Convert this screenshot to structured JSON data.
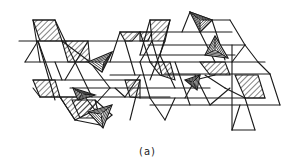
{
  "figure": {
    "caption": "(a)",
    "stroke_color": "#1a1a1a",
    "background": "#ffffff",
    "hatch_color": "#1a1a1a",
    "lines": [
      [
        19,
        41,
        152,
        41
      ],
      [
        25,
        62,
        152,
        62
      ],
      [
        140,
        32,
        232,
        32
      ],
      [
        148,
        45,
        245,
        45
      ],
      [
        140,
        55,
        235,
        55
      ],
      [
        155,
        62,
        265,
        62
      ],
      [
        165,
        74,
        270,
        74
      ],
      [
        33,
        80,
        140,
        80
      ],
      [
        40,
        97,
        170,
        97
      ],
      [
        70,
        88,
        210,
        88
      ],
      [
        110,
        75,
        200,
        75
      ],
      [
        140,
        98,
        265,
        98
      ],
      [
        150,
        105,
        280,
        105
      ],
      [
        33,
        20,
        55,
        20
      ],
      [
        33,
        20,
        40,
        62
      ],
      [
        55,
        20,
        75,
        62
      ],
      [
        38,
        41,
        25,
        62
      ],
      [
        38,
        41,
        52,
        80
      ],
      [
        38,
        41,
        55,
        100
      ],
      [
        62,
        41,
        90,
        62
      ],
      [
        75,
        62,
        92,
        97
      ],
      [
        55,
        62,
        62,
        80
      ],
      [
        90,
        62,
        110,
        88
      ],
      [
        88,
        41,
        65,
        80
      ],
      [
        120,
        32,
        140,
        32
      ],
      [
        120,
        32,
        110,
        62
      ],
      [
        140,
        32,
        150,
        62
      ],
      [
        150,
        20,
        170,
        20
      ],
      [
        150,
        20,
        140,
        55
      ],
      [
        170,
        20,
        160,
        55
      ],
      [
        125,
        41,
        135,
        75
      ],
      [
        152,
        41,
        162,
        75
      ],
      [
        152,
        41,
        140,
        62
      ],
      [
        140,
        62,
        150,
        98
      ],
      [
        160,
        55,
        175,
        88
      ],
      [
        175,
        62,
        190,
        105
      ],
      [
        165,
        41,
        150,
        80
      ],
      [
        190,
        12,
        182,
        32
      ],
      [
        190,
        12,
        212,
        20
      ],
      [
        212,
        20,
        200,
        32
      ],
      [
        200,
        32,
        215,
        62
      ],
      [
        212,
        20,
        230,
        20
      ],
      [
        230,
        20,
        245,
        45
      ],
      [
        212,
        20,
        225,
        60
      ],
      [
        245,
        45,
        232,
        62
      ],
      [
        245,
        45,
        258,
        62
      ],
      [
        232,
        45,
        232,
        130
      ],
      [
        258,
        62,
        270,
        74
      ],
      [
        205,
        75,
        225,
        88
      ],
      [
        225,
        88,
        245,
        98
      ],
      [
        230,
        88,
        210,
        105
      ],
      [
        245,
        98,
        255,
        130
      ],
      [
        255,
        130,
        232,
        130
      ],
      [
        232,
        130,
        240,
        105
      ],
      [
        33,
        88,
        40,
        97
      ],
      [
        60,
        97,
        75,
        120
      ],
      [
        75,
        120,
        100,
        125
      ],
      [
        100,
        125,
        112,
        115
      ],
      [
        112,
        115,
        95,
        100
      ],
      [
        90,
        110,
        110,
        88
      ],
      [
        115,
        88,
        125,
        97
      ],
      [
        125,
        97,
        140,
        75
      ],
      [
        140,
        80,
        130,
        120
      ],
      [
        150,
        98,
        165,
        120
      ],
      [
        165,
        120,
        175,
        98
      ],
      [
        185,
        98,
        195,
        80
      ],
      [
        195,
        80,
        215,
        75
      ],
      [
        210,
        105,
        195,
        75
      ],
      [
        270,
        74,
        280,
        105
      ]
    ],
    "hatched_polygons": [
      [
        [
          33,
          20
        ],
        [
          55,
          20
        ],
        [
          62,
          41
        ],
        [
          40,
          41
        ]
      ],
      [
        [
          62,
          41
        ],
        [
          88,
          41
        ],
        [
          90,
          62
        ],
        [
          68,
          62
        ]
      ],
      [
        [
          120,
          32
        ],
        [
          140,
          32
        ],
        [
          132,
          41
        ],
        [
          125,
          41
        ]
      ],
      [
        [
          150,
          20
        ],
        [
          170,
          20
        ],
        [
          165,
          41
        ],
        [
          152,
          41
        ]
      ],
      [
        [
          33,
          80
        ],
        [
          55,
          80
        ],
        [
          60,
          97
        ],
        [
          40,
          97
        ]
      ],
      [
        [
          60,
          97
        ],
        [
          85,
          97
        ],
        [
          95,
          110
        ],
        [
          75,
          120
        ]
      ],
      [
        [
          150,
          62
        ],
        [
          170,
          62
        ],
        [
          175,
          80
        ],
        [
          160,
          75
        ]
      ],
      [
        [
          125,
          80
        ],
        [
          140,
          80
        ],
        [
          140,
          98
        ],
        [
          130,
          97
        ]
      ],
      [
        [
          200,
          62
        ],
        [
          225,
          62
        ],
        [
          230,
          75
        ],
        [
          210,
          75
        ]
      ],
      [
        [
          235,
          75
        ],
        [
          258,
          75
        ],
        [
          265,
          98
        ],
        [
          245,
          98
        ]
      ],
      [
        [
          72,
          100
        ],
        [
          95,
          100
        ],
        [
          100,
          118
        ],
        [
          80,
          118
        ]
      ],
      [
        [
          140,
          32
        ],
        [
          152,
          32
        ],
        [
          148,
          41
        ],
        [
          140,
          41
        ]
      ]
    ],
    "tetrahedra": [
      {
        "outer": [
          [
            88,
            62
          ],
          [
            112,
            52
          ],
          [
            102,
            72
          ]
        ],
        "apex": [
          104,
          62
        ]
      },
      {
        "outer": [
          [
            215,
            36
          ],
          [
            205,
            55
          ],
          [
            228,
            58
          ]
        ],
        "apex": [
          215,
          50
        ]
      },
      {
        "outer": [
          [
            88,
            112
          ],
          [
            112,
            105
          ],
          [
            103,
            128
          ]
        ],
        "apex": [
          101,
          114
        ]
      },
      {
        "outer": [
          [
            190,
            12
          ],
          [
            212,
            20
          ],
          [
            200,
            32
          ]
        ],
        "apex": [
          200,
          20
        ]
      },
      {
        "outer": [
          [
            73,
            88
          ],
          [
            95,
            95
          ],
          [
            78,
            100
          ]
        ],
        "apex": [
          82,
          94
        ]
      },
      {
        "outer": [
          [
            185,
            80
          ],
          [
            200,
            75
          ],
          [
            197,
            90
          ]
        ],
        "apex": [
          193,
          82
        ]
      }
    ]
  }
}
